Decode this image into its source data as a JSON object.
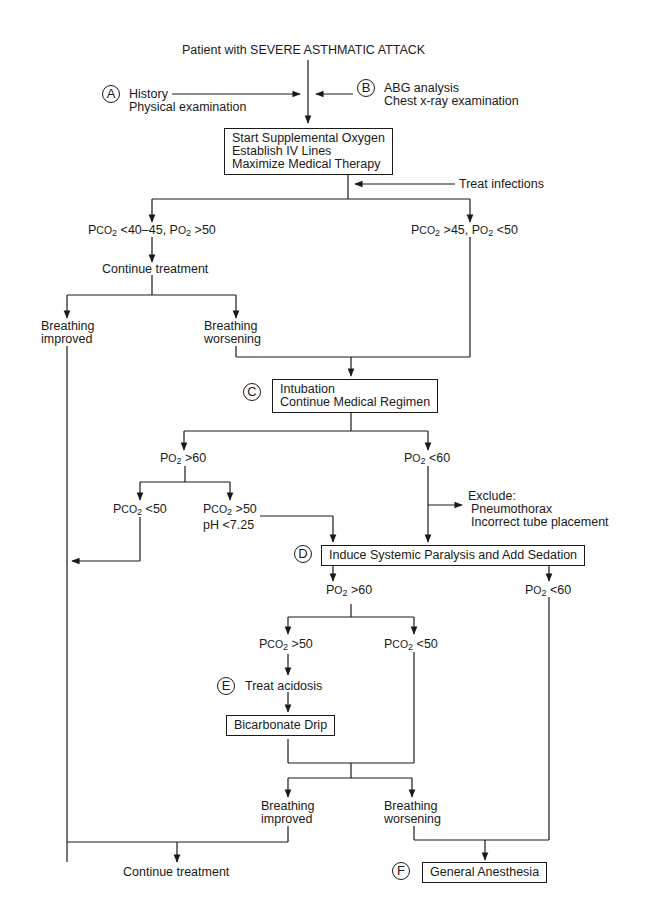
{
  "title": "Patient with SEVERE ASTHMATIC ATTACK",
  "markers": {
    "A": "A",
    "B": "B",
    "C": "C",
    "D": "D",
    "E": "E",
    "F": "F"
  },
  "inputs": {
    "A": {
      "line1": "History",
      "line2": "Physical examination"
    },
    "B": {
      "line1": "ABG analysis",
      "line2": "Chest x-ray examination"
    },
    "treat_infections": "Treat infections"
  },
  "box1": {
    "line1": "Start Supplemental Oxygen",
    "line2": "Establish IV Lines",
    "line3": "Maximize Medical Therapy"
  },
  "branch1": {
    "left": {
      "p1": "P",
      "co2": "CO",
      "s1": "2",
      "rest1": " <40–45, P",
      "o2": "O",
      "s2": "2",
      "rest2": " >50"
    },
    "right": {
      "p1": "P",
      "co2": "CO",
      "s1": "2",
      "rest1": " >45, P",
      "o2": "O",
      "s2": "2",
      "rest2": " <50"
    },
    "continue": "Continue treatment",
    "improved": {
      "line1": "Breathing",
      "line2": "improved"
    },
    "worsening": {
      "line1": "Breathing",
      "line2": "worsening"
    }
  },
  "boxC": {
    "line1": "Intubation",
    "line2": "Continue Medical Regimen"
  },
  "branch2": {
    "po2_gt60": {
      "p": "P",
      "o": "O",
      "s": "2",
      "rest": " >60"
    },
    "po2_lt60": {
      "p": "P",
      "o": "O",
      "s": "2",
      "rest": " <60"
    },
    "pco2_lt50": {
      "p": "P",
      "co": "CO",
      "s": "2",
      "rest": " <50"
    },
    "pco2_gt50": {
      "p": "P",
      "co": "CO",
      "s": "2",
      "rest": " >50",
      "ph": "pH  <7.25"
    },
    "exclude": {
      "line1": "Exclude:",
      "line2": "Pneumothorax",
      "line3": "Incorrect tube placement"
    }
  },
  "boxD": "Induce Systemic Paralysis and Add Sedation",
  "branch3": {
    "po2_gt60": {
      "p": "P",
      "o": "O",
      "s": "2",
      "rest": " >60"
    },
    "po2_lt60": {
      "p": "P",
      "o": "O",
      "s": "2",
      "rest": " <60"
    },
    "pco2_gt50": {
      "p": "P",
      "co": "CO",
      "s": "2",
      "rest": " >50"
    },
    "pco2_lt50": {
      "p": "P",
      "co": "CO",
      "s": "2",
      "rest": " <50"
    },
    "treat_acidosis": "Treat acidosis"
  },
  "boxBicarb": "Bicarbonate Drip",
  "branch4": {
    "improved": {
      "line1": "Breathing",
      "line2": "improved"
    },
    "worsening": {
      "line1": "Breathing",
      "line2": "worsening"
    }
  },
  "final": {
    "continue": "Continue treatment",
    "anesthesia": "General Anesthesia"
  }
}
